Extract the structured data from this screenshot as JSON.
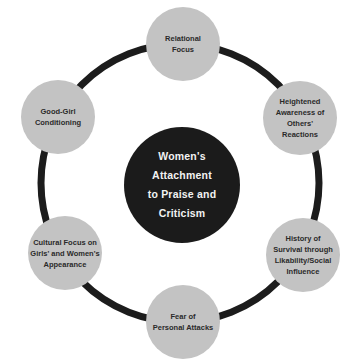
{
  "diagram": {
    "type": "cycle",
    "colors": {
      "ring": "#1c1c1c",
      "node_fill": "#c3c3c3",
      "node_text": "#2a2a2a",
      "center_fill": "#1b1b1b",
      "center_text": "#f2f2f2",
      "background": "#ffffff"
    },
    "center": {
      "label": "Women's\nAttachment\nto Praise and\nCriticism"
    },
    "nodes": [
      {
        "id": "top",
        "label": "Relational\nFocus"
      },
      {
        "id": "upper-right",
        "label": "Heightened\nAwareness of\nOthers'\nReactions"
      },
      {
        "id": "lower-right",
        "label": "History of\nSurvival through\nLikability/Social\nInfluence"
      },
      {
        "id": "bottom",
        "label": "Fear of\nPersonal Attacks"
      },
      {
        "id": "lower-left",
        "label": "Cultural Focus on\nGirls' and Women's\nAppearance"
      },
      {
        "id": "upper-left",
        "label": "Good-Girl\nConditioning"
      }
    ]
  }
}
